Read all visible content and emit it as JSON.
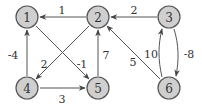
{
  "graph": {
    "title": "Weighted directed graph",
    "nodes": [
      {
        "id": "1",
        "label": "1",
        "x": 27,
        "y": 17
      },
      {
        "id": "2",
        "label": "2",
        "x": 98,
        "y": 17
      },
      {
        "id": "3",
        "label": "3",
        "x": 169,
        "y": 17
      },
      {
        "id": "4",
        "label": "4",
        "x": 27,
        "y": 88
      },
      {
        "id": "5",
        "label": "5",
        "x": 98,
        "y": 88
      },
      {
        "id": "6",
        "label": "6",
        "x": 169,
        "y": 88
      }
    ],
    "edges": [
      {
        "from": "2",
        "to": "1",
        "weight": "1"
      },
      {
        "from": "3",
        "to": "2",
        "weight": "2"
      },
      {
        "from": "4",
        "to": "1",
        "weight": "-4"
      },
      {
        "from": "2",
        "to": "4",
        "weight": "2"
      },
      {
        "from": "1",
        "to": "5",
        "weight": "-1"
      },
      {
        "from": "5",
        "to": "2",
        "weight": "7"
      },
      {
        "from": "4",
        "to": "5",
        "weight": "3"
      },
      {
        "from": "6",
        "to": "2",
        "weight": "5"
      },
      {
        "from": "6",
        "to": "3",
        "weight": "10"
      },
      {
        "from": "3",
        "to": "6",
        "weight": "-8"
      }
    ]
  }
}
